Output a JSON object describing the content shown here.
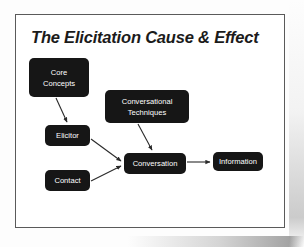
{
  "slide": {
    "title": "The Elicitation Cause & Effect",
    "background_color": "#ffffff",
    "border_color": "#5a5a5a",
    "node_fill_color": "#161616",
    "node_text_color": "#ffffff",
    "connector_color": "#2a2a2a"
  },
  "diagram": {
    "nodes": [
      {
        "id": "core-concepts",
        "line1": "Core",
        "line2": "Concepts"
      },
      {
        "id": "conv-techniques",
        "line1": "Conversational",
        "line2": "Techniques"
      },
      {
        "id": "elicitor",
        "line1": "Elicitor",
        "line2": ""
      },
      {
        "id": "contact",
        "line1": "Contact",
        "line2": ""
      },
      {
        "id": "conversation",
        "line1": "Conversation",
        "line2": ""
      },
      {
        "id": "information",
        "line1": "Information",
        "line2": ""
      }
    ],
    "edges": [
      {
        "from": "core-concepts",
        "to": "elicitor"
      },
      {
        "from": "elicitor",
        "to": "conversation"
      },
      {
        "from": "contact",
        "to": "conversation"
      },
      {
        "from": "conv-techniques",
        "to": "conversation"
      },
      {
        "from": "conversation",
        "to": "information"
      }
    ]
  }
}
